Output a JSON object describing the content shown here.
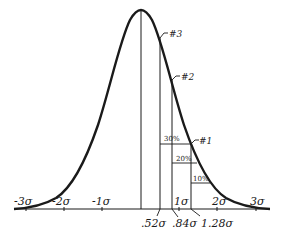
{
  "diagram": {
    "axis_labels": [
      "-3σ",
      "-2σ",
      "-1σ",
      "1σ",
      "2σ",
      "3σ"
    ],
    "cutoff_labels": [
      ".52σ",
      ".84σ",
      "1.28σ"
    ],
    "markers": [
      "#3",
      "#2",
      "#1"
    ],
    "percent_labels": [
      "30%",
      "20%",
      "10%"
    ],
    "colors": {
      "ink": "#1a1a1a",
      "background": "#ffffff"
    }
  }
}
